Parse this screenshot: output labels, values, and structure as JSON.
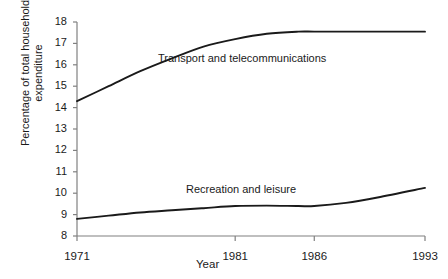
{
  "chart_data": {
    "type": "line",
    "title": "",
    "xlabel": "Year",
    "ylabel": "Percentage of total household\nexpenditure",
    "xlim": [
      1971,
      1993
    ],
    "ylim": [
      8,
      18
    ],
    "grid": false,
    "legend_position": "inline-annotations",
    "x_ticks": [
      1971,
      1981,
      1986,
      1993
    ],
    "x_tick_labels": [
      "1971",
      "1981",
      "1986",
      "1993"
    ],
    "y_ticks": [
      8,
      9,
      10,
      11,
      12,
      13,
      14,
      15,
      16,
      17,
      18
    ],
    "y_tick_labels": [
      "8",
      "9",
      "10",
      "11",
      "12",
      "13",
      "14",
      "15",
      "16",
      "17",
      "18"
    ],
    "line_color": "#1a1a1a",
    "axis_color": "#808080",
    "series": [
      {
        "name": "Transport and telecommunications",
        "x": [
          1971,
          1973,
          1975,
          1977,
          1979,
          1981,
          1983,
          1985,
          1986,
          1988,
          1990,
          1993
        ],
        "values": [
          14.3,
          15.0,
          15.7,
          16.3,
          16.85,
          17.2,
          17.45,
          17.55,
          17.55,
          17.55,
          17.55,
          17.55
        ]
      },
      {
        "name": "Recreation and leisure",
        "x": [
          1971,
          1973,
          1975,
          1977,
          1979,
          1981,
          1983,
          1985,
          1986,
          1988,
          1990,
          1993
        ],
        "values": [
          8.8,
          8.95,
          9.1,
          9.2,
          9.3,
          9.4,
          9.42,
          9.4,
          9.4,
          9.55,
          9.8,
          10.25
        ]
      }
    ]
  },
  "annotations": {
    "transport_label": "Transport and telecommunications",
    "recreation_label": "Recreation and leisure"
  },
  "axes": {
    "x_title": "Year",
    "y_title_line1": "Percentage of total household",
    "y_title_line2": "expenditure"
  }
}
